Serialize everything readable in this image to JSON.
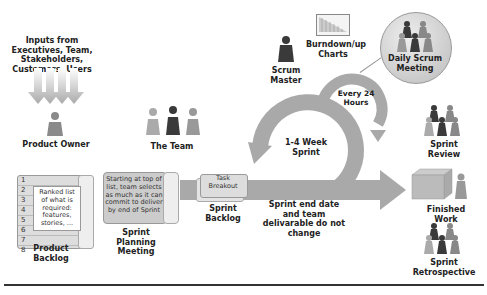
{
  "inputs": {
    "label": "Inputs from Executives, Team, Stakeholders, Customers, Users"
  },
  "roles": {
    "product_owner": "Product Owner",
    "team": "The Team",
    "scrum_master": "Scrum Master"
  },
  "artifacts": {
    "burndown": "Burndown/up Charts",
    "product_backlog": {
      "title": "Product Backlog",
      "rows": [
        "1",
        "2",
        "3",
        "4",
        "5",
        "6",
        "7",
        "8"
      ],
      "note": "Ranked list of what is required: features, stories, ..."
    },
    "sprint_planning": {
      "title": "Sprint Planning Meeting",
      "note": "Starting at top of list, team selects as much as it can commit to deliver by end of Sprint"
    },
    "sprint_backlog": {
      "title": "Sprint Backlog",
      "card": "Task Breakout"
    }
  },
  "cycles": {
    "daily": "Every 24 Hours",
    "sprint": "1-4 Week Sprint"
  },
  "events": {
    "daily_scrum": "Daily Scrum Meeting",
    "sprint_review": "Sprint Review",
    "finished_work": "Finished Work",
    "retrospective": "Sprint Retrospective"
  },
  "constraint": "Sprint end date and team delivarable do not change",
  "colors": {
    "arrow": "#a9a9a9",
    "dark_person": "#3a3a3a",
    "light_person": "#9a9a9a"
  }
}
